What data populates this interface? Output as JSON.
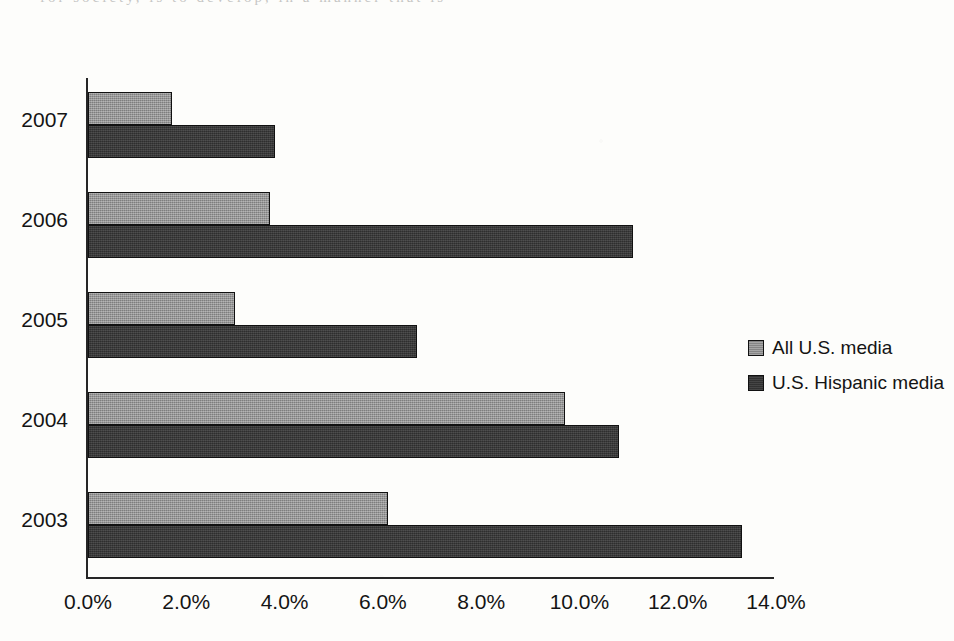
{
  "page": {
    "bleed_text": "for society, is to develop, in a manner that is"
  },
  "legend": {
    "position": "right",
    "entries": [
      {
        "label": "All U.S. media",
        "color": "#8d8d8d"
      },
      {
        "label": "U.S. Hispanic media",
        "color": "#373737"
      }
    ]
  },
  "axis": {
    "tick_labels": [
      "0.0%",
      "2.0%",
      "4.0%",
      "6.0%",
      "8.0%",
      "10.0%",
      "12.0%",
      "14.0%"
    ],
    "tick_values": [
      0,
      2,
      4,
      6,
      8,
      10,
      12,
      14
    ]
  },
  "chart_data": {
    "type": "bar",
    "orientation": "horizontal",
    "title": "",
    "xlabel": "",
    "ylabel": "",
    "xlim": [
      0,
      14
    ],
    "ylim": null,
    "grid": false,
    "legend_position": "right",
    "categories": [
      "2007",
      "2006",
      "2005",
      "2004",
      "2003"
    ],
    "tick_labels": [
      "0.0%",
      "2.0%",
      "4.0%",
      "6.0%",
      "8.0%",
      "10.0%",
      "12.0%",
      "14.0%"
    ],
    "series": [
      {
        "name": "All U.S. media",
        "color": "#8d8d8d",
        "values": [
          1.7,
          3.7,
          3.0,
          9.7,
          6.1
        ]
      },
      {
        "name": "U.S. Hispanic media",
        "color": "#373737",
        "values": [
          3.8,
          11.1,
          6.7,
          10.8,
          13.3
        ]
      }
    ]
  }
}
